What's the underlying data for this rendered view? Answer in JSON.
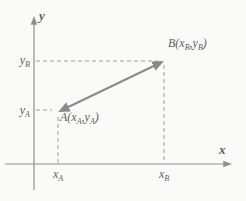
{
  "colors": {
    "background": "#fafaf8",
    "axis": "#8f8f8f",
    "dash": "#9d9d9d",
    "segment": "#8a8a8a",
    "text": "#5e5e5e"
  },
  "axes": {
    "x_label": "x",
    "y_label": "y"
  },
  "axis_ticks": {
    "y_b": {
      "base": "y",
      "sub": "B"
    },
    "y_a": {
      "base": "y",
      "sub": "A"
    },
    "x_a": {
      "base": "x",
      "sub": "A"
    },
    "x_b": {
      "base": "x",
      "sub": "B"
    }
  },
  "points": {
    "a": {
      "name": "A",
      "open": "(x",
      "sub1": "A",
      "sep": ",y",
      "sub2": "A",
      "close": ")"
    },
    "b": {
      "name": "B",
      "open": "(x",
      "sub1": "B",
      "sep": ",y",
      "sub2": "B",
      "close": ")"
    }
  }
}
